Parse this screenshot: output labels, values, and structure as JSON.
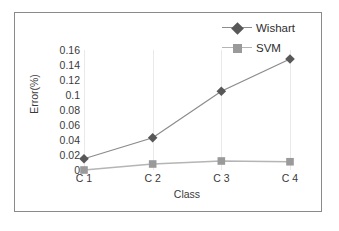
{
  "chart_data": {
    "type": "line",
    "title": "",
    "xlabel": "Class",
    "ylabel": "Error(%)",
    "categories": [
      "C 1",
      "C 2",
      "C 3",
      "C 4"
    ],
    "ylim": [
      0,
      0.16
    ],
    "yticks": [
      "0.16",
      "0.14",
      "0.12",
      "0.1",
      "0.08",
      "0.06",
      "0.04",
      "0.02",
      "0"
    ],
    "ytick_values": [
      0.16,
      0.14,
      0.12,
      0.1,
      0.08,
      0.06,
      0.04,
      0.02,
      0
    ],
    "grid": "vertical",
    "legend_position": "top-right",
    "series": [
      {
        "name": "Wishart",
        "marker": "diamond",
        "color": "#585858",
        "line_color": "#8c8c8c",
        "values": [
          0.015,
          0.043,
          0.105,
          0.148
        ]
      },
      {
        "name": "SVM",
        "marker": "square",
        "color": "#9a9a9a",
        "line_color": "#b5b5b5",
        "values": [
          0.0,
          0.008,
          0.012,
          0.011
        ]
      }
    ]
  },
  "figure": {
    "frame_color": "#8a8a8a",
    "background": "#ffffff",
    "gridline_color": "#e9e9e9",
    "text_color": "#3a3a3a"
  },
  "legend": {
    "entries": [
      {
        "label": "Wishart"
      },
      {
        "label": "SVM"
      }
    ]
  },
  "axes": {
    "x_title": "Class",
    "y_title": "Error(%)",
    "x_tick_labels": [
      "C 1",
      "C 2",
      "C 3",
      "C 4"
    ],
    "y_tick_labels": [
      "0.16",
      "0.14",
      "0.12",
      "0.1",
      "0.08",
      "0.06",
      "0.04",
      "0.02",
      "0"
    ]
  }
}
